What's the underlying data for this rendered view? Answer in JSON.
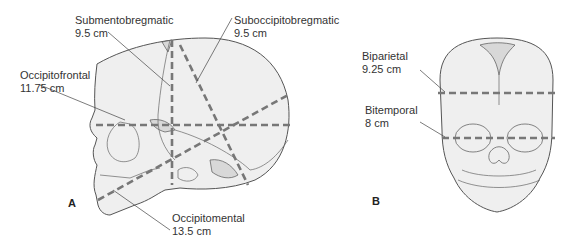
{
  "figure": {
    "panel_a": {
      "label": "A",
      "view": "lateral skull",
      "measurements": [
        {
          "name": "Submentobregmatic",
          "value": "9.5 cm"
        },
        {
          "name": "Suboccipitobregmatic",
          "value": "9.5 cm"
        },
        {
          "name": "Occipitofrontal",
          "value": "11.75 cm"
        },
        {
          "name": "Occipitomental",
          "value": "13.5 cm"
        }
      ]
    },
    "panel_b": {
      "label": "B",
      "view": "frontal skull",
      "measurements": [
        {
          "name": "Biparietal",
          "value": "9.25 cm"
        },
        {
          "name": "Bitemporal",
          "value": "8 cm"
        }
      ]
    },
    "colors": {
      "skull_fill": "#efefef",
      "fontanelle_fill": "#d8d8d8",
      "outline": "#555555",
      "dashed_line": "#777777",
      "text": "#333333"
    }
  }
}
